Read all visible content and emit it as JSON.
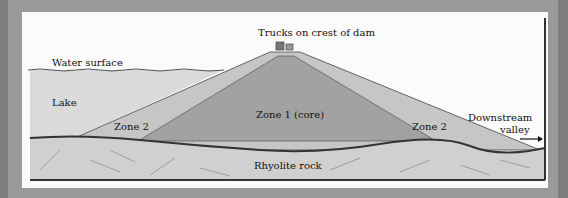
{
  "diagram": {
    "type": "dam cross-section",
    "labels": {
      "trucks": "Trucks on crest of dam",
      "water_surface": "Water surface",
      "lake": "Lake",
      "zone2_left": "Zone 2",
      "zone1_core": "Zone 1 (core)",
      "zone2_right": "Zone 2",
      "downstream": "Downstream",
      "valley": "valley",
      "bedrock": "Rhyolite rock"
    },
    "colors": {
      "page_border": "#8e8e8e",
      "card_bg": "#fbfbfb",
      "lake": "#d8d8d8",
      "zone2": "#c4c4c4",
      "core": "#a3a3a3",
      "rock": "#cfcfcf",
      "rock_line": "#3a3a3a"
    }
  }
}
